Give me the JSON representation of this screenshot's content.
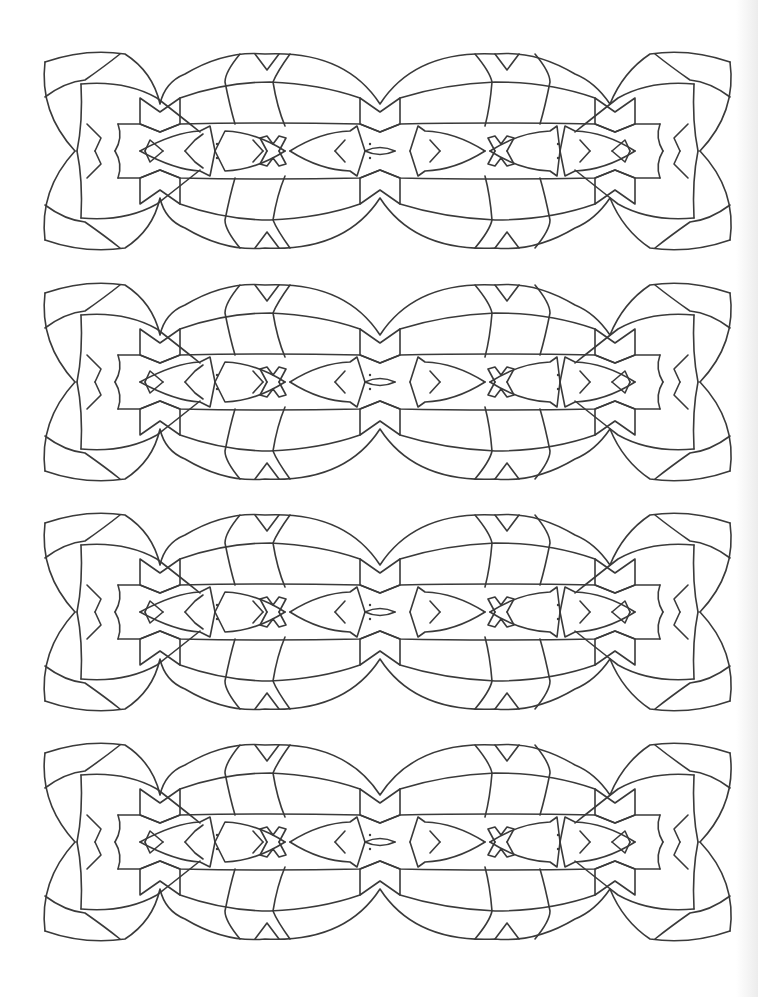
{
  "page": {
    "type": "coloring-page",
    "background_color": "#ffffff",
    "line_color": "#3a3a3a"
  },
  "bands": [
    {
      "id": "band-1",
      "top": 52
    },
    {
      "id": "band-2",
      "top": 283
    },
    {
      "id": "band-3",
      "top": 513
    },
    {
      "id": "band-4",
      "top": 743
    }
  ],
  "band_motif": {
    "width": 686,
    "height": 198,
    "outer_lobes": 4,
    "junctions": 3,
    "inner_fish_motifs": 4,
    "x_motifs": 2,
    "eye_motifs": 3
  }
}
